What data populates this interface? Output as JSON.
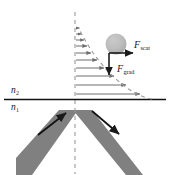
{
  "figure": {
    "background_color": "#ffffff"
  },
  "labels": {
    "n2": {
      "symbol": "n",
      "subscript": "2",
      "text": "n2"
    },
    "n1": {
      "symbol": "n",
      "subscript": "1",
      "text": "n1"
    },
    "f_scat": {
      "symbol": "F",
      "subscript": "scat",
      "text": "Fscat"
    },
    "f_grad": {
      "symbol": "F",
      "subscript": "grad",
      "text": "Fgrad"
    }
  },
  "colors": {
    "beam_gray": "#808080",
    "particle_gray": "#b8b8b8",
    "line_black": "#1a1a1a",
    "field_arrow_gray": "#6e6e6e",
    "dashed_gray": "#9a9a9a"
  },
  "geometry": {
    "interface_y": 99,
    "interface_x_start": 4,
    "interface_x_end": 166,
    "normal_line_x": 75,
    "normal_line_y_start": 12,
    "normal_line_y_end": 172,
    "field_arrow_origin_x": 76,
    "particle": {
      "cx": 116,
      "cy": 44,
      "r": 10
    },
    "force_origin": {
      "x": 109,
      "y": 53
    },
    "f_scat_tip": {
      "x": 133,
      "y": 53
    },
    "f_grad_tip": {
      "x": 109,
      "y": 74
    }
  },
  "evanescent_field": {
    "description": "Exponentially decaying evanescent field amplitude above the interface, drawn as horizontal arrows whose lengths decay with height.",
    "arrow_y_positions": [
      28,
      34,
      40,
      46,
      53,
      60,
      68,
      76,
      85,
      94
    ],
    "arrow_lengths": [
      3,
      5,
      8,
      11,
      15,
      21,
      28,
      38,
      50,
      64
    ],
    "envelope": "dashed exponential curve joining arrow tips"
  },
  "beams": {
    "incident": {
      "direction": "up-right",
      "arrow_from": [
        40,
        133
      ],
      "arrow_to": [
        66,
        113
      ]
    },
    "reflected": {
      "direction": "down-right",
      "arrow_from": [
        93,
        112
      ],
      "arrow_to": [
        119,
        133
      ]
    }
  }
}
